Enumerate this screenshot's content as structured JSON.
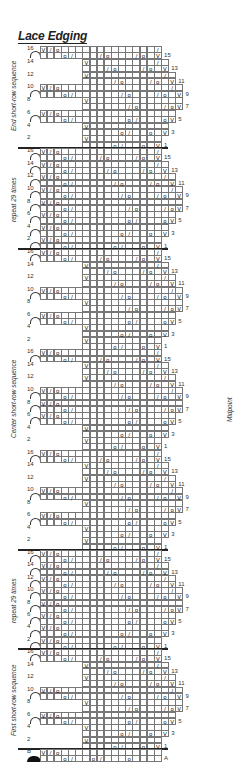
{
  "title": "Lace Edging",
  "midpoint_label": "Midpoint",
  "sections": [
    {
      "label": "End short-row sequence",
      "top": 46,
      "bottom": 148,
      "blocks": [
        "short"
      ]
    },
    {
      "label": "repeat 29 times",
      "top": 148,
      "bottom": 249,
      "blocks": [
        "repeat"
      ]
    },
    {
      "label": "Center short-row sequence",
      "top": 249,
      "bottom": 550,
      "blocks": [
        "short",
        "center",
        "short"
      ]
    },
    {
      "label": "repeat 29 times",
      "top": 550,
      "bottom": 649,
      "blocks": [
        "repeat"
      ]
    },
    {
      "label": "First short-row sequence",
      "top": 649,
      "bottom": 749,
      "blocks": [
        "short"
      ]
    }
  ],
  "setup_rows": {
    "labels": [
      "B",
      "A"
    ]
  },
  "symbols": {
    "knit": "",
    "yo": "o",
    "k2tog": "/",
    "slip": "V"
  },
  "patterns": {
    "short": [
      {
        "n": "16",
        "cells": {
          "0": "V",
          "1": "/",
          "2": "o",
          "3": "",
          "4": "",
          "5": "",
          "6": "",
          "7": "",
          "8": "",
          "9": "",
          "10": "",
          "11": "",
          "12": "",
          "13": "",
          "14": "",
          "15": "",
          "16": "/"
        },
        "arc": true,
        "len": 17
      },
      {
        "n": "15",
        "cells": {
          "3": "o",
          "4": "/",
          "8": "/",
          "9": "o",
          "13": "/",
          "14": "o",
          "16": "V"
        },
        "len": 17,
        "rnum": "15"
      },
      {
        "n": "14",
        "cells": {
          "6": "V",
          "16": "/"
        },
        "start": 6,
        "len": 18
      },
      {
        "n": "13",
        "cells": {
          "9": "/",
          "10": "o",
          "14": "/",
          "15": "o",
          "17": "V"
        },
        "start": 6,
        "len": 18,
        "rnum": "13"
      },
      {
        "n": "12",
        "cells": {
          "6": "V",
          "17": "/"
        },
        "start": 6,
        "len": 19
      },
      {
        "n": "11",
        "cells": {
          "10": "/",
          "11": "o",
          "15": "/",
          "16": "o",
          "18": "V"
        },
        "start": 6,
        "len": 19,
        "rnum": "11"
      },
      {
        "n": "10",
        "cells": {
          "0": "V",
          "1": "/",
          "2": "o",
          "18": "/"
        },
        "arc": true,
        "len": 20
      },
      {
        "n": "9",
        "cells": {
          "3": "o",
          "4": "/",
          "11": "/",
          "12": "o",
          "16": "/",
          "17": "o",
          "19": "V"
        },
        "len": 20,
        "rnum": "9"
      },
      {
        "n": "8",
        "cells": {
          "6": "V"
        },
        "start": 6,
        "len": 20
      },
      {
        "n": "7",
        "cells": {
          "12": "/",
          "13": "o",
          "17": "/",
          "18": "o",
          "19": "V"
        },
        "start": 6,
        "len": 20,
        "rnum": "7"
      },
      {
        "n": "6",
        "cells": {
          "0": "V",
          "1": "/",
          "2": "o"
        },
        "arc": true,
        "len": 19
      },
      {
        "n": "5",
        "cells": {
          "3": "o",
          "4": "/",
          "12": "o",
          "13": "/",
          "17": "o",
          "18": "V"
        },
        "len": 19,
        "rnum": "5"
      },
      {
        "n": "4",
        "cells": {
          "6": "V"
        },
        "start": 6,
        "len": 18
      },
      {
        "n": "3",
        "cells": {
          "11": "o",
          "12": "/",
          "15": "o",
          "17": "V"
        },
        "start": 6,
        "len": 18,
        "rnum": "3"
      },
      {
        "n": "2",
        "cells": {
          "6": "V"
        },
        "start": 6,
        "len": 17
      },
      {
        "n": "1",
        "cells": {
          "10": "o",
          "11": "/",
          "14": "o",
          "16": "V"
        },
        "start": 6,
        "len": 17,
        "rnum": "1"
      }
    ],
    "center": [
      {
        "n": "16",
        "cells": {
          "0": "V",
          "1": "/",
          "2": "o",
          "16": "/"
        },
        "arc": true,
        "len": 17
      },
      {
        "n": "15",
        "cells": {
          "3": "o",
          "4": "/",
          "8": "/",
          "9": "o",
          "13": "/",
          "14": "o",
          "16": "V"
        },
        "len": 17,
        "rnum": "15"
      },
      {
        "n": "14",
        "cells": {
          "6": "V",
          "16": "/"
        },
        "start": 6,
        "len": 18
      },
      {
        "n": "13",
        "cells": {
          "9": "/",
          "10": "o",
          "14": "/",
          "15": "o",
          "17": "V"
        },
        "start": 6,
        "len": 18,
        "rnum": "13"
      },
      {
        "n": "12",
        "cells": {
          "6": "V",
          "17": "/"
        },
        "start": 6,
        "len": 19
      },
      {
        "n": "11",
        "cells": {
          "10": "/",
          "11": "o",
          "15": "/",
          "16": "o",
          "18": "V"
        },
        "start": 6,
        "len": 19,
        "rnum": "11"
      },
      {
        "n": "10",
        "cells": {
          "0": "V",
          "1": "/",
          "2": "o",
          "18": "/"
        },
        "arc": true,
        "len": 20
      },
      {
        "n": "9",
        "cells": {
          "3": "o",
          "4": "/",
          "11": "/",
          "12": "o",
          "16": "/",
          "17": "o",
          "19": "V"
        },
        "len": 20,
        "rnum": "9"
      },
      {
        "n": "8",
        "cells": {
          "0": "V",
          "1": "/",
          "2": "o"
        },
        "arc": true,
        "len": 20
      },
      {
        "n": "7",
        "cells": {
          "3": "o",
          "4": "/",
          "12": "/",
          "13": "o",
          "17": "/",
          "18": "o",
          "19": "V"
        },
        "len": 20,
        "rnum": "7"
      },
      {
        "n": "6",
        "cells": {
          "0": "V",
          "1": "/",
          "2": "o"
        },
        "arc": true,
        "len": 19
      },
      {
        "n": "5",
        "cells": {
          "3": "o",
          "4": "/",
          "12": "o",
          "13": "/",
          "17": "o",
          "18": "V"
        },
        "len": 19,
        "rnum": "5"
      },
      {
        "n": "4",
        "cells": {
          "6": "V"
        },
        "start": 6,
        "len": 18
      },
      {
        "n": "3",
        "cells": {
          "11": "o",
          "12": "/",
          "15": "o",
          "17": "V"
        },
        "start": 6,
        "len": 18,
        "rnum": "3"
      },
      {
        "n": "2",
        "cells": {
          "6": "V"
        },
        "start": 6,
        "len": 17
      },
      {
        "n": "1",
        "cells": {
          "10": "o",
          "11": "/",
          "14": "o",
          "16": "V"
        },
        "start": 6,
        "len": 17,
        "rnum": "1"
      }
    ],
    "repeat": [
      {
        "n": "16",
        "cells": {
          "0": "V",
          "1": "/",
          "2": "o",
          "16": "/"
        },
        "arc": true,
        "len": 17
      },
      {
        "n": "15",
        "cells": {
          "3": "o",
          "4": "/",
          "8": "/",
          "9": "o",
          "13": "/",
          "14": "o",
          "16": "V"
        },
        "len": 17,
        "rnum": "15"
      },
      {
        "n": "14",
        "cells": {
          "0": "V",
          "1": "/",
          "2": "o",
          "16": "/"
        },
        "arc": true,
        "len": 18
      },
      {
        "n": "13",
        "cells": {
          "3": "o",
          "4": "/",
          "9": "/",
          "10": "o",
          "14": "/",
          "15": "o",
          "17": "V"
        },
        "len": 18,
        "rnum": "13"
      },
      {
        "n": "12",
        "cells": {
          "0": "V",
          "1": "/",
          "2": "o",
          "17": "/"
        },
        "arc": true,
        "len": 19
      },
      {
        "n": "11",
        "cells": {
          "3": "o",
          "4": "/",
          "10": "/",
          "11": "o",
          "15": "/",
          "16": "o",
          "18": "V"
        },
        "len": 19,
        "rnum": "11"
      },
      {
        "n": "10",
        "cells": {
          "0": "V",
          "1": "/",
          "2": "o",
          "18": "/"
        },
        "arc": true,
        "len": 20
      },
      {
        "n": "9",
        "cells": {
          "3": "o",
          "4": "/",
          "11": "/",
          "12": "o",
          "16": "/",
          "17": "o",
          "19": "V"
        },
        "len": 20,
        "rnum": "9"
      },
      {
        "n": "8",
        "cells": {
          "0": "V",
          "1": "/",
          "2": "o"
        },
        "arc": true,
        "len": 20
      },
      {
        "n": "7",
        "cells": {
          "3": "o",
          "4": "/",
          "12": "/",
          "13": "o",
          "17": "/",
          "18": "o",
          "19": "V"
        },
        "len": 20,
        "rnum": "7"
      },
      {
        "n": "6",
        "cells": {
          "0": "V",
          "1": "/",
          "2": "o"
        },
        "arc": true,
        "len": 19
      },
      {
        "n": "5",
        "cells": {
          "3": "o",
          "4": "/",
          "12": "o",
          "13": "/",
          "17": "o",
          "18": "V"
        },
        "len": 19,
        "rnum": "5"
      },
      {
        "n": "4",
        "cells": {
          "0": "V",
          "1": "/",
          "2": "o"
        },
        "arc": true,
        "len": 18
      },
      {
        "n": "3",
        "cells": {
          "3": "o",
          "4": "/",
          "11": "o",
          "12": "/",
          "15": "o",
          "17": "V"
        },
        "len": 18,
        "rnum": "3"
      },
      {
        "n": "2",
        "cells": {
          "0": "V",
          "1": "/",
          "2": "o"
        },
        "arc": true,
        "len": 17
      },
      {
        "n": "1",
        "cells": {
          "3": "o",
          "4": "/",
          "10": "o",
          "11": "/",
          "14": "o",
          "16": "V"
        },
        "len": 17,
        "rnum": "1"
      }
    ],
    "setup": [
      {
        "n": "B",
        "cells": {
          "0": "V",
          "1": "/",
          "2": "o"
        },
        "bind": true,
        "len": 17
      },
      {
        "n": "",
        "cells": {
          "3": "o",
          "4": "/",
          "7": "o",
          "8": "/",
          "12": "o"
        },
        "len": 17,
        "rnum": "A"
      }
    ]
  }
}
